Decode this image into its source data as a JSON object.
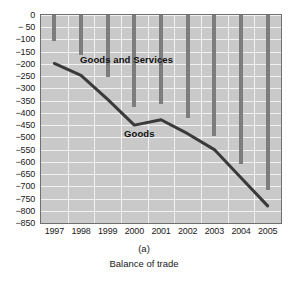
{
  "figure": {
    "panel_letter": "(a)",
    "caption": "Balance of trade"
  },
  "labels": {
    "goods_and_services": "Goods and Services",
    "goods": "Goods"
  },
  "colors": {
    "plot_background": "#c9c9c9",
    "gridline": "#f2f2f2",
    "bar": "#7d7d7d",
    "line": "#3a3a3a",
    "frame": "#6f6f6f",
    "text": "#1a1a1a"
  },
  "chart_data": {
    "type": "bar",
    "title": "",
    "subtitle": "",
    "xlabel": "",
    "ylabel": "",
    "categories": [
      "1997",
      "1998",
      "1999",
      "2000",
      "2001",
      "2002",
      "2003",
      "2004",
      "2005"
    ],
    "xlim": [
      "1997",
      "2005"
    ],
    "ylim": [
      -850,
      0
    ],
    "ytick_values": [
      0,
      -50,
      -100,
      -150,
      -200,
      -250,
      -300,
      -350,
      -400,
      -450,
      -500,
      -550,
      -600,
      -650,
      -700,
      -750,
      -800,
      -850
    ],
    "ytick_labels": [
      "0",
      "− 50",
      "−100",
      "−150",
      "−200",
      "−250",
      "−300",
      "−350",
      "−400",
      "−450",
      "−500",
      "−550",
      "−600",
      "−650",
      "−700",
      "−750",
      "−800",
      "−850"
    ],
    "grid": true,
    "legend_position": "inline-annotation",
    "series": [
      {
        "name": "Goods and Services",
        "render": "bar",
        "baseline": 0,
        "values": [
          -105,
          -165,
          -255,
          -375,
          -365,
          -420,
          -495,
          -610,
          -715
        ]
      },
      {
        "name": "Goods",
        "render": "line",
        "values": [
          -198,
          -247,
          -345,
          -450,
          -428,
          -485,
          -550,
          -665,
          -780
        ]
      }
    ]
  }
}
